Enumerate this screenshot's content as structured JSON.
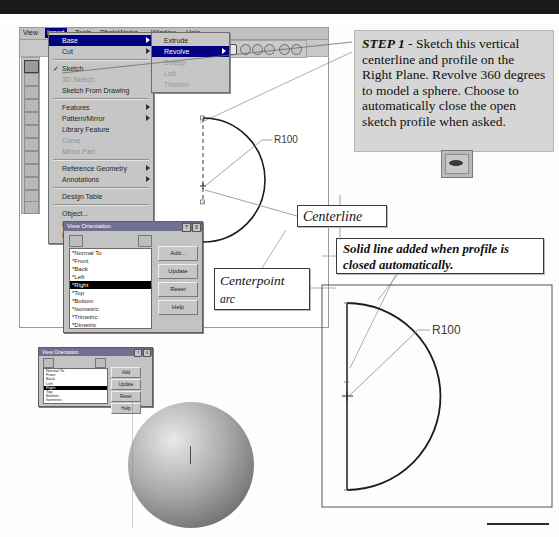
{
  "page": {
    "accent_selected": "#000080",
    "dialog_face": "#c3c3c3"
  },
  "cad_window": {
    "menubar": [
      {
        "label": "View",
        "selected": false
      },
      {
        "label": "Insert",
        "selected": true
      },
      {
        "label": "Tools",
        "selected": false
      },
      {
        "label": "PhotoWorks",
        "selected": false
      },
      {
        "label": "Window",
        "selected": false
      },
      {
        "label": "Help",
        "selected": false
      }
    ],
    "insert_menu": [
      {
        "label": "Base",
        "state": "highlighted",
        "submenu": true,
        "checked": false
      },
      {
        "label": "Cut",
        "state": "normal",
        "submenu": true,
        "checked": false
      },
      {
        "label": "Sketch",
        "state": "normal",
        "submenu": false,
        "checked": true
      },
      {
        "label": "3D Sketch",
        "state": "disabled",
        "submenu": false,
        "checked": false
      },
      {
        "label": "Sketch From Drawing",
        "state": "normal",
        "submenu": false,
        "checked": false
      },
      {
        "label": "Features",
        "state": "normal",
        "submenu": true,
        "checked": false
      },
      {
        "label": "Pattern/Mirror",
        "state": "normal",
        "submenu": true,
        "checked": false
      },
      {
        "label": "Library Feature",
        "state": "normal",
        "submenu": false,
        "checked": false
      },
      {
        "label": "Curve",
        "state": "disabled",
        "submenu": false,
        "checked": false
      },
      {
        "label": "Mirror Part",
        "state": "disabled",
        "submenu": false,
        "checked": false
      },
      {
        "label": "Reference Geometry",
        "state": "normal",
        "submenu": true,
        "checked": false
      },
      {
        "label": "Annotations",
        "state": "normal",
        "submenu": true,
        "checked": false
      },
      {
        "label": "Design Table",
        "state": "normal",
        "submenu": false,
        "checked": false
      },
      {
        "label": "Object...",
        "state": "normal",
        "submenu": false,
        "checked": false
      },
      {
        "label": "Hyperlink...",
        "state": "normal",
        "submenu": false,
        "checked": false
      },
      {
        "label": "Picture",
        "state": "normal",
        "submenu": false,
        "checked": false
      }
    ],
    "base_submenu": [
      {
        "label": "Extrude",
        "state": "normal",
        "submenu": false
      },
      {
        "label": "Revolve",
        "state": "highlighted",
        "submenu": true
      },
      {
        "label": "Sweep",
        "state": "disabled",
        "submenu": false
      },
      {
        "label": "Loft",
        "state": "disabled",
        "submenu": false
      },
      {
        "label": "Thicken",
        "state": "disabled",
        "submenu": false
      }
    ]
  },
  "view_orientation_dialog_1": {
    "title": "View Orientation",
    "title_buttons": [
      "?",
      "X"
    ],
    "items": [
      {
        "label": "*Normal To",
        "selected": false
      },
      {
        "label": "*Front",
        "selected": false
      },
      {
        "label": "*Back",
        "selected": false
      },
      {
        "label": "*Left",
        "selected": false
      },
      {
        "label": "*Right",
        "selected": true
      },
      {
        "label": "*Top",
        "selected": false
      },
      {
        "label": "*Bottom",
        "selected": false
      },
      {
        "label": "*Isometric",
        "selected": false
      },
      {
        "label": "*Trimetric",
        "selected": false
      },
      {
        "label": "*Dimetric",
        "selected": false
      }
    ],
    "buttons": [
      "Add...",
      "Update",
      "Reset",
      "Help"
    ]
  },
  "view_orientation_dialog_2": {
    "title": "View Orientation",
    "title_buttons": [
      "?",
      "X"
    ],
    "items": [
      {
        "label": "Normal To",
        "selected": false
      },
      {
        "label": "Front",
        "selected": false
      },
      {
        "label": "Back",
        "selected": false
      },
      {
        "label": "Left",
        "selected": false
      },
      {
        "label": "Right",
        "selected": true
      },
      {
        "label": "Top",
        "selected": false
      },
      {
        "label": "Bottom",
        "selected": false
      },
      {
        "label": "Isometric",
        "selected": false
      }
    ],
    "buttons": [
      "Add",
      "Update",
      "Reset",
      "Help"
    ]
  },
  "callouts": {
    "step1_prefix": "STEP 1",
    "step1_body": " - Sketch this vertical centerline and profile on the Right Plane.  Revolve 360 degrees to model a sphere. Choose to automatically close the open sketch profile when asked.",
    "centerline": "Centerline",
    "centerpoint_arc_line1": "Centerpoint",
    "centerpoint_arc_line2": "arc",
    "solid_line_note": "Solid line added when profile is closed automatically."
  },
  "sketch_left": {
    "dimension_label": "R100",
    "centerline_style": "dashed",
    "arc_type": "centerpoint-arc"
  },
  "sketch_right": {
    "dimension_label": "R100",
    "profile_style": "closed-solid"
  },
  "model": {
    "shape": "sphere",
    "shading": "shaded-gray"
  }
}
